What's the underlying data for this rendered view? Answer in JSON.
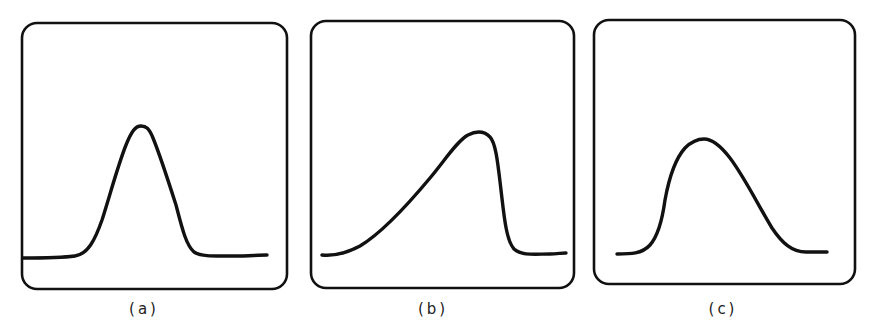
{
  "figure": {
    "stroke_color": "#111111",
    "background": "#ffffff",
    "panels": [
      {
        "id": "a",
        "label": "(a)",
        "description": "symmetric narrow peak",
        "box": {
          "x": 22,
          "y": 23,
          "w": 265,
          "h": 266,
          "r": 15
        },
        "label_pos": {
          "x": 144,
          "y": 300
        },
        "path": "M23,258 C40,258 60,258 75,256 C88,254 95,240 102,220 C110,195 118,165 126,145 C132,130 136,126 141,126 C146,126 149,128 153,138 C160,155 168,180 176,205 C182,228 186,245 194,252 C202,257 215,256 235,256 C248,256 258,255 267,255"
      },
      {
        "id": "b",
        "label": "(b)",
        "description": "peak with tailing on the leading edge (slow rise, sharp fall)",
        "box": {
          "x": 311,
          "y": 21,
          "w": 263,
          "h": 267,
          "r": 15
        },
        "label_pos": {
          "x": 433,
          "y": 300
        },
        "path": "M322,255 C332,256 345,254 360,246 C380,234 405,208 430,178 C445,160 458,140 468,135 C476,131 484,131 490,137 C496,143 498,165 501,190 C504,215 506,240 514,249 C522,256 535,254 550,254 C556,254 562,253 566,253"
      },
      {
        "id": "c",
        "label": "(c)",
        "description": "peak with tailing on the trailing edge (sharp rise, slow fall)",
        "box": {
          "x": 594,
          "y": 20,
          "w": 261,
          "h": 264,
          "r": 15
        },
        "label_pos": {
          "x": 723,
          "y": 300
        },
        "path": "M617,254 C630,254 642,254 650,245 C658,236 662,222 665,200 C669,178 676,158 685,148 C692,141 698,139 704,139 C712,139 720,145 730,158 C745,178 758,205 772,228 C782,243 792,252 806,252 C815,252 822,252 827,252"
      }
    ]
  },
  "chart_data": [
    {
      "type": "line",
      "title": "(a)",
      "xlabel": "",
      "ylabel": "",
      "grid": false,
      "legend": null,
      "shape": "symmetric peak",
      "x": [
        0,
        0.2,
        0.3,
        0.37,
        0.44,
        0.48,
        0.52,
        0.58,
        0.65,
        0.7,
        0.8,
        1.0
      ],
      "y": [
        0.0,
        0.01,
        0.1,
        0.57,
        0.9,
        1.0,
        0.97,
        0.57,
        0.12,
        0.02,
        0.01,
        0.01
      ]
    },
    {
      "type": "line",
      "title": "(b)",
      "xlabel": "",
      "ylabel": "",
      "grid": false,
      "legend": null,
      "shape": "fronting/leading-edge tail peak",
      "x": [
        0,
        0.05,
        0.17,
        0.32,
        0.48,
        0.56,
        0.62,
        0.69,
        0.72,
        0.75,
        0.78,
        0.83,
        1.0
      ],
      "y": [
        0.0,
        0.01,
        0.12,
        0.37,
        0.73,
        0.93,
        1.0,
        0.93,
        0.68,
        0.28,
        0.08,
        0.01,
        0.01
      ]
    },
    {
      "type": "line",
      "title": "(c)",
      "xlabel": "",
      "ylabel": "",
      "grid": false,
      "legend": null,
      "shape": "tailing/trailing-edge tail peak",
      "x": [
        0,
        0.11,
        0.2,
        0.25,
        0.33,
        0.41,
        0.49,
        0.6,
        0.73,
        0.85,
        1.0
      ],
      "y": [
        0.0,
        0.02,
        0.25,
        0.68,
        0.92,
        1.0,
        0.9,
        0.55,
        0.2,
        0.02,
        0.02
      ]
    }
  ]
}
